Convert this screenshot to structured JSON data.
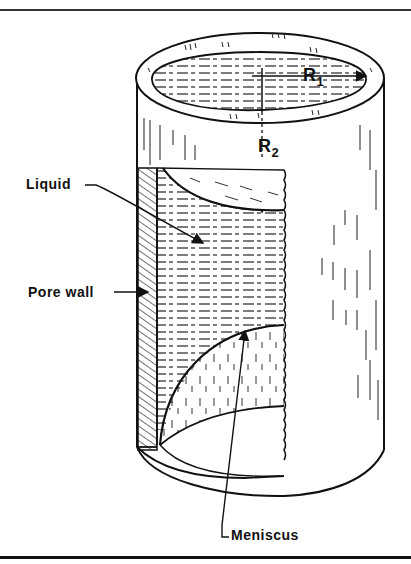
{
  "figure": {
    "type": "diagram",
    "labels": {
      "liquid": "Liquid",
      "pore_wall": "Pore wall",
      "meniscus": "Meniscus",
      "r1_main": "R",
      "r1_sub": "1",
      "r2_main": "R",
      "r2_sub": "2"
    },
    "colors": {
      "ink": "#111111",
      "background": "#ffffff"
    }
  }
}
